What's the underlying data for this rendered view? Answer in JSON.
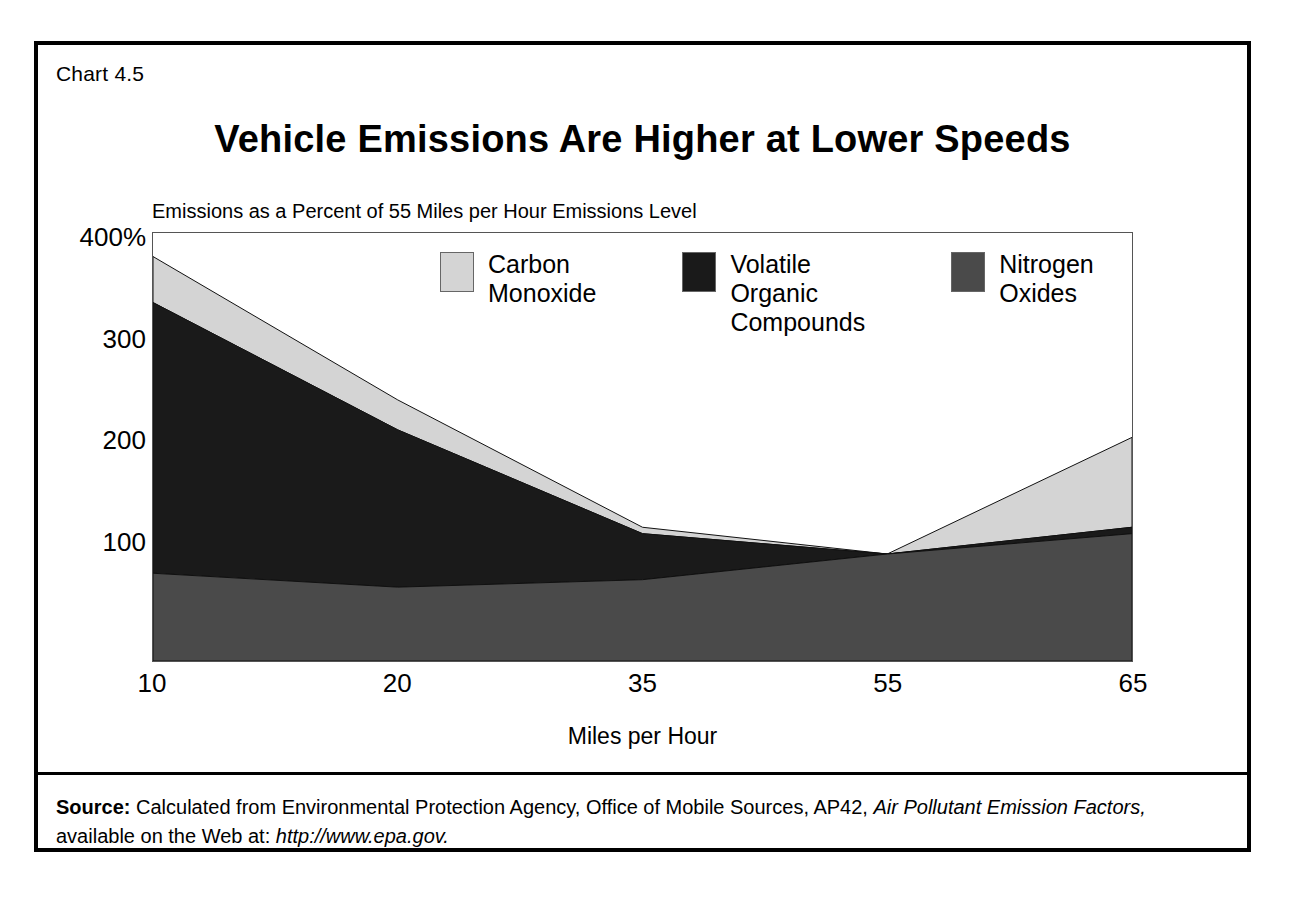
{
  "chart_number": "Chart 4.5",
  "title": "Vehicle Emissions Are Higher at Lower Speeds",
  "subtitle": "Emissions as a Percent of 55 Miles per Hour Emissions Level",
  "axis": {
    "xlabel": "Miles per Hour",
    "ytick_400": "400%",
    "ytick_300": "300",
    "ytick_200": "200",
    "ytick_100": "100",
    "xtick_0": "10",
    "xtick_1": "20",
    "xtick_2": "35",
    "xtick_3": "55",
    "xtick_4": "65"
  },
  "legend": [
    {
      "label": "Carbon\nMonoxide",
      "color": "#d4d4d4"
    },
    {
      "label": "Volatile\nOrganic\nCompounds",
      "color": "#1a1a1a"
    },
    {
      "label": "Nitrogen\nOxides",
      "color": "#4a4a4a"
    }
  ],
  "source": {
    "label": "Source:",
    "line1": " Calculated from Environmental Protection Agency, Office of Mobile Sources, AP42, ",
    "italic1": "Air Pollutant Emission Factors,",
    "line2": " available on the Web at: ",
    "italic2": "http://www.epa.gov."
  },
  "chart_data": {
    "type": "area",
    "stacked": true,
    "title": "Vehicle Emissions Are Higher at Lower Speeds",
    "subtitle": "Emissions as a Percent of 55 Miles per Hour Emissions Level",
    "xlabel": "Miles per Hour",
    "ylabel": "",
    "categories": [
      10,
      20,
      35,
      55,
      65
    ],
    "tick_labels": [
      "10",
      "20",
      "35",
      "55",
      "65"
    ],
    "yticks": [
      100,
      200,
      300,
      400
    ],
    "ytick_labels": [
      "100",
      "200",
      "300",
      "400%"
    ],
    "ylim": [
      0,
      400
    ],
    "grid": false,
    "legend_position": "top-inside",
    "series": [
      {
        "name": "Nitrogen Oxides",
        "color": "#4a4a4a",
        "values": [
          82,
          69,
          76,
          100,
          119
        ]
      },
      {
        "name": "Volatile Organic Compounds",
        "color": "#1a1a1a",
        "values": [
          253,
          147,
          43,
          0,
          6
        ]
      },
      {
        "name": "Carbon Monoxide",
        "color": "#d4d4d4",
        "values": [
          43,
          28,
          6,
          0,
          84
        ]
      }
    ],
    "cumulative_tops": {
      "nitrogen_oxides": [
        82,
        69,
        76,
        100,
        119
      ],
      "voc_top": [
        335,
        216,
        119,
        100,
        125
      ],
      "total": [
        378,
        244,
        125,
        100,
        209
      ]
    }
  }
}
